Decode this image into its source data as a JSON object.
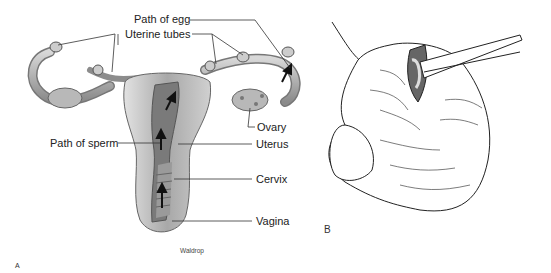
{
  "figure": {
    "panel_a": {
      "panel_label": "A",
      "credit": "Waldrop",
      "labels": {
        "path_of_egg": "Path of egg",
        "uterine_tubes": "Uterine tubes",
        "ovary": "Ovary",
        "path_of_sperm": "Path of sperm",
        "uterus": "Uterus",
        "cervix": "Cervix",
        "vagina": "Vagina"
      }
    },
    "panel_b": {
      "panel_label": "B"
    }
  }
}
